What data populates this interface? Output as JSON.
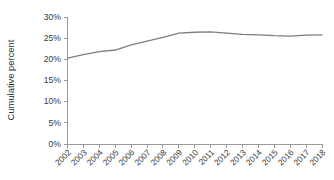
{
  "chart_data": {
    "type": "line",
    "title": "",
    "xlabel": "",
    "ylabel": "Cumulative percent",
    "x": [
      2002,
      2003,
      2004,
      2005,
      2006,
      2007,
      2008,
      2009,
      2010,
      2011,
      2012,
      2013,
      2014,
      2015,
      2016,
      2017,
      2018
    ],
    "categories": [
      "2002",
      "2003",
      "2004",
      "2005",
      "2006",
      "2007",
      "2008",
      "2009",
      "2010",
      "2011",
      "2012",
      "2013",
      "2014",
      "2015",
      "2016",
      "2017",
      "2018"
    ],
    "values": [
      20.3,
      21.1,
      21.8,
      22.2,
      23.4,
      24.3,
      25.2,
      26.2,
      26.4,
      26.5,
      26.2,
      25.9,
      25.8,
      25.6,
      25.5,
      25.7,
      25.8
    ],
    "series": [
      {
        "name": "Cumulative percent",
        "color": "#7d7d7d",
        "values": [
          20.3,
          21.1,
          21.8,
          22.2,
          23.4,
          24.3,
          25.2,
          26.2,
          26.4,
          26.5,
          26.2,
          25.9,
          25.8,
          25.6,
          25.5,
          25.7,
          25.8
        ]
      }
    ],
    "ylim": [
      0,
      30
    ],
    "xlim": [
      2002,
      2018
    ],
    "ytick_values": [
      0,
      5,
      10,
      15,
      20,
      25,
      30
    ],
    "ytick_labels": [
      "0%",
      "5%",
      "10%",
      "15%",
      "20%",
      "25%",
      "30%"
    ],
    "grid": false,
    "legend": false,
    "legend_position": "none",
    "xtick_rotation": -45,
    "axis_color": "#9a9a9a",
    "line_color": "#7d7d7d",
    "background": "#ffffff"
  }
}
